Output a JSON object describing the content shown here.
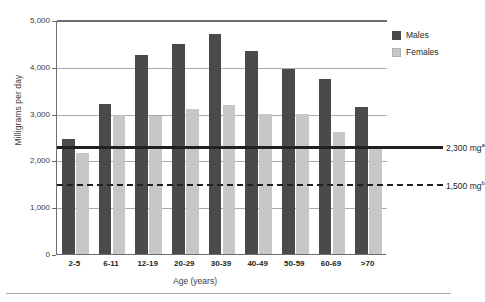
{
  "chart_data": {
    "type": "bar",
    "title": "",
    "xlabel": "Age (years)",
    "ylabel": "Milligrams per day",
    "ylim": [
      0,
      5000
    ],
    "ytick_labels": [
      "0",
      "1,000",
      "2,000",
      "3,000",
      "4,000",
      "5,000"
    ],
    "ytick_values": [
      0,
      1000,
      2000,
      3000,
      4000,
      5000
    ],
    "grid": true,
    "legend_position": "right",
    "categories": [
      "2-5",
      "6-11",
      "12-19",
      "20-29",
      "30-39",
      "40-49",
      "50-59",
      "60-69",
      ">70"
    ],
    "series": [
      {
        "name": "Males",
        "color": "#4a4a4c",
        "values": [
          2450,
          3200,
          4250,
          4480,
          4700,
          4330,
          3960,
          3730,
          3140
        ]
      },
      {
        "name": "Females",
        "color": "#c6c7c9",
        "values": [
          2150,
          2980,
          2950,
          3100,
          3190,
          3000,
          2990,
          2600,
          2280
        ]
      }
    ],
    "reference_lines": [
      {
        "name": "upper-limit",
        "value": 2300,
        "style": "solid",
        "label": "2,300 mg",
        "footnote": "a"
      },
      {
        "name": "lower-limit",
        "value": 1500,
        "style": "dashed",
        "label": "1,500 mg",
        "footnote": "b"
      }
    ]
  },
  "legend": {
    "items": [
      {
        "label": "Males",
        "color": "#4a4a4c"
      },
      {
        "label": "Females",
        "color": "#c6c7c9"
      }
    ]
  }
}
